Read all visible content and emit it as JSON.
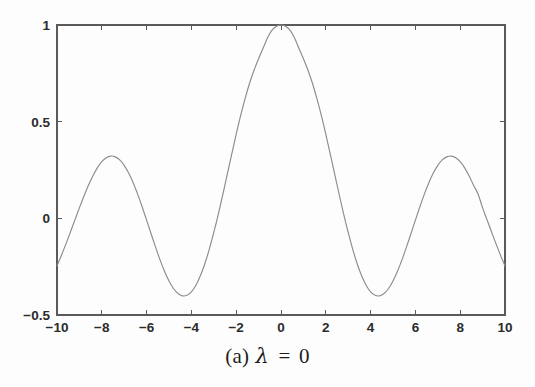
{
  "figure": {
    "caption_prefix": "(a)",
    "caption_symbol": "λ",
    "caption_equals": "=",
    "caption_value": "0",
    "caption_full": "(a) λ = 0"
  },
  "colors": {
    "background": "#fdfdfd",
    "axis": "#5a5a5a",
    "curve": "#8c8c8c",
    "label_text": "#2b2b2b",
    "caption_text": "#1d1d1d"
  },
  "chart_data": {
    "type": "line",
    "title": "",
    "subtitle": "",
    "xlabel": "",
    "ylabel": "",
    "xlim": [
      -10,
      10
    ],
    "ylim": [
      -0.5,
      1
    ],
    "grid": false,
    "legend": null,
    "box_frame": true,
    "tick_direction": "in",
    "xticks": [
      -10,
      -8,
      -6,
      -4,
      -2,
      0,
      2,
      4,
      6,
      8,
      10
    ],
    "xticklabels": [
      "-10",
      "-8",
      "-6",
      "-4",
      "-2",
      "0",
      "2",
      "4",
      "6",
      "8",
      "10"
    ],
    "yticks": [
      -0.5,
      0,
      0.5,
      1
    ],
    "yticklabels": [
      "-0.5",
      "0",
      "0.5",
      "1"
    ],
    "annotations": [
      {
        "text": "peak at x=0 reaching y=1"
      },
      {
        "text": "side lobes near x=±7 reaching y≈0.31"
      },
      {
        "text": "troughs near x=±3.8 reaching y≈-0.40"
      }
    ],
    "series": [
      {
        "name": "curve",
        "x": [
          -10,
          -9.8,
          -9.6,
          -9.4,
          -9.2,
          -9,
          -8.8,
          -8.6,
          -8.4,
          -8.2,
          -8,
          -7.8,
          -7.6,
          -7.4,
          -7.2,
          -7,
          -6.8,
          -6.6,
          -6.4,
          -6.2,
          -6,
          -5.8,
          -5.6,
          -5.4,
          -5.2,
          -5,
          -4.8,
          -4.6,
          -4.4,
          -4.2,
          -4,
          -3.8,
          -3.6,
          -3.4,
          -3.2,
          -3,
          -2.8,
          -2.6,
          -2.4,
          -2.2,
          -2,
          -1.8,
          -1.6,
          -1.4,
          -1.2,
          -1,
          -0.8,
          -0.6,
          -0.4,
          -0.2,
          0,
          0.2,
          0.4,
          0.6,
          0.8,
          1,
          1.2,
          1.4,
          1.6,
          1.8,
          2,
          2.2,
          2.4,
          2.6,
          2.8,
          3,
          3.2,
          3.4,
          3.6,
          3.8,
          4,
          4.2,
          4.4,
          4.6,
          4.8,
          5,
          5.2,
          5.4,
          5.6,
          5.8,
          6,
          6.2,
          6.4,
          6.6,
          6.8,
          7,
          7.2,
          7.4,
          7.6,
          7.8,
          8,
          8.2,
          8.4,
          8.6,
          8.8,
          9,
          9.2,
          9.4,
          9.6,
          9.8,
          10
        ],
        "y": [
          -0.246,
          -0.191,
          -0.132,
          -0.071,
          -0.008,
          0.054,
          0.114,
          0.17,
          0.219,
          0.261,
          0.293,
          0.313,
          0.322,
          0.318,
          0.302,
          0.274,
          0.234,
          0.184,
          0.125,
          0.06,
          -0.009,
          -0.08,
          -0.149,
          -0.215,
          -0.274,
          -0.324,
          -0.363,
          -0.389,
          -0.401,
          -0.398,
          -0.38,
          -0.346,
          -0.297,
          -0.235,
          -0.159,
          -0.073,
          0.021,
          0.122,
          0.227,
          0.332,
          0.435,
          0.532,
          0.62,
          0.7,
          0.767,
          0.825,
          0.88,
          0.934,
          0.973,
          0.993,
          1,
          0.993,
          0.973,
          0.934,
          0.88,
          0.825,
          0.767,
          0.7,
          0.62,
          0.532,
          0.435,
          0.332,
          0.227,
          0.122,
          0.021,
          -0.073,
          -0.159,
          -0.235,
          -0.297,
          -0.346,
          -0.38,
          -0.398,
          -0.401,
          -0.389,
          -0.363,
          -0.324,
          -0.274,
          -0.215,
          -0.149,
          -0.08,
          -0.009,
          0.06,
          0.125,
          0.184,
          0.234,
          0.274,
          0.302,
          0.318,
          0.322,
          0.313,
          0.293,
          0.261,
          0.219,
          0.17,
          0.125,
          0.054,
          -0.008,
          -0.071,
          -0.132,
          -0.191,
          -0.246
        ]
      }
    ]
  },
  "geometry": {
    "plot_left": 57,
    "plot_right": 505,
    "plot_top": 25,
    "plot_bottom": 315
  }
}
